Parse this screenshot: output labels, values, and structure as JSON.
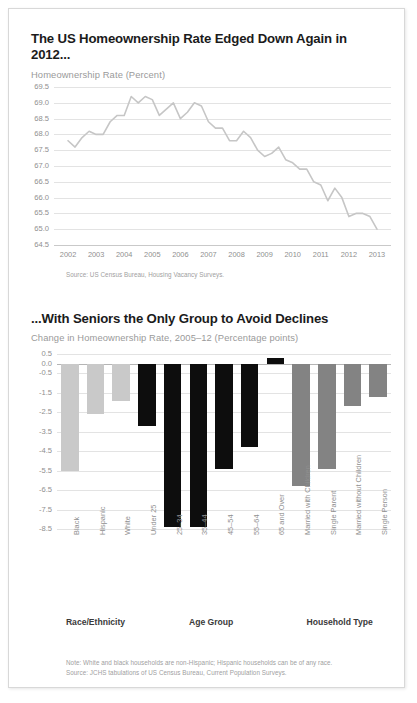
{
  "document": {
    "frame_color": "#d8d8d8",
    "background": "#ffffff"
  },
  "panel_top": {
    "title": "The US Homeownership Rate Edged Down Again in 2012...",
    "subtitle": "Homeownership Rate (Percent)",
    "source_note": "Source: US Census Bureau, Housing Vacancy Surveys."
  },
  "panel_bottom": {
    "title": "...With Seniors the Only Group to Avoid Declines",
    "subtitle": "Change in Homeownership Rate, 2005–12 (Percentage points)",
    "note": "Note: White and black households are non-Hispanic; Hispanic households can be of any race.",
    "source_note": "Source: JCHS tabulations of US Census Bureau, Current Population Surveys."
  },
  "chart_data": [
    {
      "type": "line",
      "title": "The US Homeownership Rate Edged Down Again in 2012...",
      "ylabel": "Homeownership Rate (Percent)",
      "xlabel": "",
      "ylim": [
        64.5,
        69.5
      ],
      "yticks": [
        "69.5",
        "69.0",
        "68.5",
        "68.0",
        "67.5",
        "67.0",
        "66.5",
        "66.0",
        "65.5",
        "65.0",
        "64.5"
      ],
      "ytick_values": [
        69.5,
        69.0,
        68.5,
        68.0,
        67.5,
        67.0,
        66.5,
        66.0,
        65.5,
        65.0,
        64.5
      ],
      "grid": true,
      "legend": "none",
      "line_color": "#c6c6c6",
      "xtick_labels": [
        "2002",
        "2003",
        "2004",
        "2005",
        "2006",
        "2007",
        "2008",
        "2009",
        "2010",
        "2011",
        "2012",
        "2013"
      ],
      "x": [
        2002.0,
        2002.25,
        2002.5,
        2002.75,
        2003.0,
        2003.25,
        2003.5,
        2003.75,
        2004.0,
        2004.25,
        2004.5,
        2004.75,
        2005.0,
        2005.25,
        2005.5,
        2005.75,
        2006.0,
        2006.25,
        2006.5,
        2006.75,
        2007.0,
        2007.25,
        2007.5,
        2007.75,
        2008.0,
        2008.25,
        2008.5,
        2008.75,
        2009.0,
        2009.25,
        2009.5,
        2009.75,
        2010.0,
        2010.25,
        2010.5,
        2010.75,
        2011.0,
        2011.25,
        2011.5,
        2011.75,
        2012.0,
        2012.25,
        2012.5,
        2012.75,
        2013.0
      ],
      "values": [
        67.8,
        67.6,
        67.9,
        68.1,
        68.0,
        68.0,
        68.4,
        68.6,
        68.6,
        69.2,
        69.0,
        69.2,
        69.1,
        68.6,
        68.8,
        69.0,
        68.5,
        68.7,
        69.0,
        68.9,
        68.4,
        68.2,
        68.2,
        67.8,
        67.8,
        68.1,
        67.9,
        67.5,
        67.3,
        67.4,
        67.6,
        67.2,
        67.1,
        66.9,
        66.9,
        66.5,
        66.4,
        65.9,
        66.3,
        66.0,
        65.4,
        65.5,
        65.5,
        65.4,
        65.0
      ]
    },
    {
      "type": "bar",
      "title": "...With Seniors the Only Group to Avoid Declines",
      "ylabel": "Change in Homeownership Rate, 2005–12 (Percentage points)",
      "xlabel": "",
      "ylim": [
        -8.5,
        0.5
      ],
      "yticks": [
        "0.5",
        "0.0",
        "-0.5",
        "-1.5",
        "-2.5",
        "-3.5",
        "-4.5",
        "-5.5",
        "-6.5",
        "-7.5",
        "-8.5"
      ],
      "ytick_values": [
        0.5,
        0.0,
        -0.5,
        -1.5,
        -2.5,
        -3.5,
        -4.5,
        -5.5,
        -6.5,
        -7.5,
        -8.5
      ],
      "grid": true,
      "legend": "none",
      "categories": [
        "Black",
        "Hispanic",
        "White",
        "Under 25",
        "25–34",
        "35–44",
        "45–54",
        "55–64",
        "65 and Over",
        "Married with Children",
        "Single Parent",
        "Married without Children",
        "Single Person"
      ],
      "values": [
        -5.5,
        -2.6,
        -1.9,
        -3.2,
        -8.4,
        -8.4,
        -5.4,
        -4.3,
        0.3,
        -6.3,
        -5.4,
        -2.2,
        -1.7
      ],
      "group_of": [
        "race",
        "race",
        "race",
        "age",
        "age",
        "age",
        "age",
        "age",
        "age",
        "household",
        "household",
        "household",
        "household"
      ],
      "groups": [
        {
          "name": "Race/Ethnicity",
          "color": "#c9c9c9",
          "start": 0,
          "end": 2
        },
        {
          "name": "Age Group",
          "color": "#0d0d0d",
          "start": 3,
          "end": 8
        },
        {
          "name": "Household Type",
          "color": "#838383",
          "start": 9,
          "end": 12
        }
      ]
    }
  ]
}
